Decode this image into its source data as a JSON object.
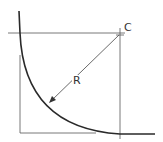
{
  "diagram": {
    "labels": {
      "center": "C",
      "radius": "R"
    },
    "colors": {
      "stroke": "#2a2a2a",
      "thin": "#555555",
      "background": "#ffffff"
    }
  }
}
